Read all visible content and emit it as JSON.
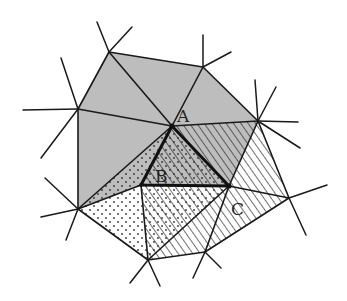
{
  "diagram": {
    "type": "triangulation",
    "labels": {
      "A": "A",
      "B": "B",
      "C": "C"
    },
    "vertices": {
      "V1": [
        109,
        52
      ],
      "V2": [
        203,
        67
      ],
      "V3": [
        78,
        109
      ],
      "A": [
        172,
        126
      ],
      "V5": [
        258,
        121
      ],
      "B": [
        141,
        185
      ],
      "Cv": [
        229,
        186
      ],
      "V8": [
        78,
        209
      ],
      "V9": [
        289,
        198
      ],
      "V10": [
        148,
        260
      ],
      "V11": [
        205,
        252
      ]
    },
    "highlighted_triangle": [
      "A",
      "B",
      "Cv"
    ],
    "colors": {
      "stroke": "#1a1a1a",
      "gray_fill": "#bdbdbd",
      "background": "#ffffff"
    }
  }
}
